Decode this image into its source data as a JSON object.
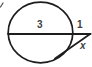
{
  "figure": {
    "type": "geometry-diagram",
    "labels": {
      "chord_segment": "3",
      "external_secant_segment": "1",
      "tangent_segment": "x"
    },
    "colors": {
      "line": "#1d1d1d",
      "stray_mark": "#4a4a4a",
      "label": "#3f3f3f",
      "background": "#ffffff"
    }
  }
}
